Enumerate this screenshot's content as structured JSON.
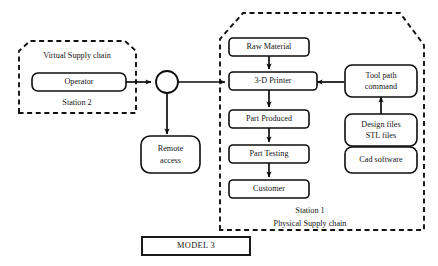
{
  "diagram": {
    "title": "MODEL 3",
    "canvas": {
      "width": 438,
      "height": 266,
      "background": "#ffffff"
    },
    "colors": {
      "stroke": "#0d0d0d",
      "fill": "#ffffff",
      "text": "#151515",
      "dashed_border": "#111111"
    },
    "groups": [
      {
        "id": "virtual-supply-chain",
        "title": "Virtual Supply chain",
        "subtitle": "Station 2",
        "border_style": "dashed"
      },
      {
        "id": "physical-supply-chain",
        "title": "Station 1",
        "subtitle": "Physical Supply chain",
        "border_style": "dashed"
      }
    ],
    "nodes": [
      {
        "id": "operator",
        "label": "Operator",
        "shape": "rounded-rect"
      },
      {
        "id": "junction",
        "label": "",
        "shape": "circle"
      },
      {
        "id": "remote-access",
        "label_line1": "Remote",
        "label_line2": "access",
        "shape": "rounded-rect"
      },
      {
        "id": "raw-material",
        "label": "Raw Material",
        "shape": "rounded-rect"
      },
      {
        "id": "three-d-printer",
        "label": "3-D Printer",
        "shape": "rounded-rect"
      },
      {
        "id": "part-produced",
        "label": "Part Produced",
        "shape": "rounded-rect"
      },
      {
        "id": "part-testing",
        "label": "Part Testing",
        "shape": "rounded-rect"
      },
      {
        "id": "customer",
        "label": "Customer",
        "shape": "rounded-rect"
      },
      {
        "id": "tool-path-command",
        "label_line1": "Tool path",
        "label_line2": "command",
        "shape": "rounded-rect"
      },
      {
        "id": "design-files",
        "label_line1": "Design files",
        "label_line2": "STL files",
        "shape": "rounded-rect"
      },
      {
        "id": "cad-software",
        "label": "Cad software",
        "shape": "rounded-rect"
      },
      {
        "id": "model",
        "label": "MODEL 3",
        "shape": "rect"
      }
    ],
    "edges": [
      {
        "from": "operator",
        "to": "junction",
        "arrow": true
      },
      {
        "from": "junction",
        "to": "remote-access",
        "arrow": true
      },
      {
        "from": "junction",
        "to": "three-d-printer",
        "arrow": true
      },
      {
        "from": "raw-material",
        "to": "three-d-printer",
        "arrow": true
      },
      {
        "from": "three-d-printer",
        "to": "part-produced",
        "arrow": true
      },
      {
        "from": "part-produced",
        "to": "part-testing",
        "arrow": true
      },
      {
        "from": "part-testing",
        "to": "customer",
        "arrow": true
      },
      {
        "from": "tool-path-command",
        "to": "three-d-printer",
        "arrow": true
      },
      {
        "from": "design-files",
        "to": "tool-path-command",
        "arrow": true
      },
      {
        "from": "cad-software",
        "to": "design-files",
        "arrow": true
      }
    ]
  }
}
